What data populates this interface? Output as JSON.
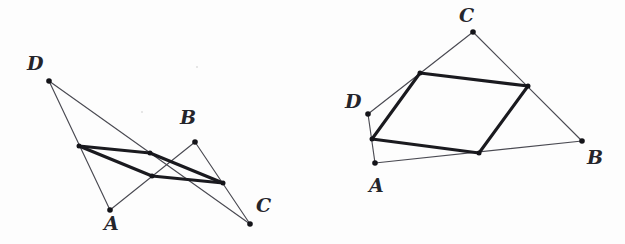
{
  "figure": {
    "caption_present": false,
    "background_color": "#fdfdfd",
    "line_color": "#4a4a52",
    "bold_line_color": "#1a1a1f",
    "point_color": "#141419",
    "label_color": "#25252b"
  },
  "figures": [
    {
      "name": "crossed-quadrilateral",
      "labels": [
        {
          "text": "D",
          "x": 27,
          "y": 54
        },
        {
          "text": "A",
          "x": 104,
          "y": 214
        },
        {
          "text": "B",
          "x": 180,
          "y": 108
        },
        {
          "text": "C",
          "x": 256,
          "y": 196
        }
      ],
      "vertices": [
        {
          "id": "A",
          "x": 110,
          "y": 210
        },
        {
          "id": "B",
          "x": 195,
          "y": 142
        },
        {
          "id": "C",
          "x": 250,
          "y": 224
        },
        {
          "id": "D",
          "x": 49,
          "y": 81
        }
      ],
      "midpoints": [
        {
          "id": "M_AB",
          "x": 152,
          "y": 176
        },
        {
          "id": "M_BC",
          "x": 223,
          "y": 183
        },
        {
          "id": "M_CD",
          "x": 150,
          "y": 153
        },
        {
          "id": "M_DA",
          "x": 79,
          "y": 146
        }
      ],
      "quad_edges": [
        {
          "from": "A",
          "to": "B"
        },
        {
          "from": "B",
          "to": "C"
        },
        {
          "from": "C",
          "to": "D"
        },
        {
          "from": "D",
          "to": "A"
        }
      ],
      "midpoint_edges": [
        {
          "from": "M_AB",
          "to": "M_BC"
        },
        {
          "from": "M_BC",
          "to": "M_CD"
        },
        {
          "from": "M_CD",
          "to": "M_DA"
        },
        {
          "from": "M_DA",
          "to": "M_AB"
        }
      ]
    },
    {
      "name": "convex-quadrilateral",
      "labels": [
        {
          "text": "C",
          "x": 459,
          "y": 6
        },
        {
          "text": "D",
          "x": 345,
          "y": 92
        },
        {
          "text": "A",
          "x": 369,
          "y": 176
        },
        {
          "text": "B",
          "x": 587,
          "y": 148
        }
      ],
      "vertices": [
        {
          "id": "A",
          "x": 375,
          "y": 163
        },
        {
          "id": "B",
          "x": 582,
          "y": 141
        },
        {
          "id": "C",
          "x": 473,
          "y": 32
        },
        {
          "id": "D",
          "x": 368,
          "y": 114
        }
      ],
      "midpoints": [
        {
          "id": "M_AB",
          "x": 479,
          "y": 153
        },
        {
          "id": "M_BC",
          "x": 528,
          "y": 86
        },
        {
          "id": "M_CD",
          "x": 420,
          "y": 73
        },
        {
          "id": "M_DA",
          "x": 372,
          "y": 139
        }
      ],
      "quad_edges": [
        {
          "from": "A",
          "to": "B"
        },
        {
          "from": "B",
          "to": "C"
        },
        {
          "from": "C",
          "to": "D"
        },
        {
          "from": "D",
          "to": "A"
        }
      ],
      "midpoint_edges": [
        {
          "from": "M_AB",
          "to": "M_BC"
        },
        {
          "from": "M_BC",
          "to": "M_CD"
        },
        {
          "from": "M_CD",
          "to": "M_DA"
        },
        {
          "from": "M_DA",
          "to": "M_AB"
        }
      ]
    }
  ],
  "specks": [
    {
      "x": 196,
      "y": 66
    },
    {
      "x": 141,
      "y": 111
    }
  ]
}
